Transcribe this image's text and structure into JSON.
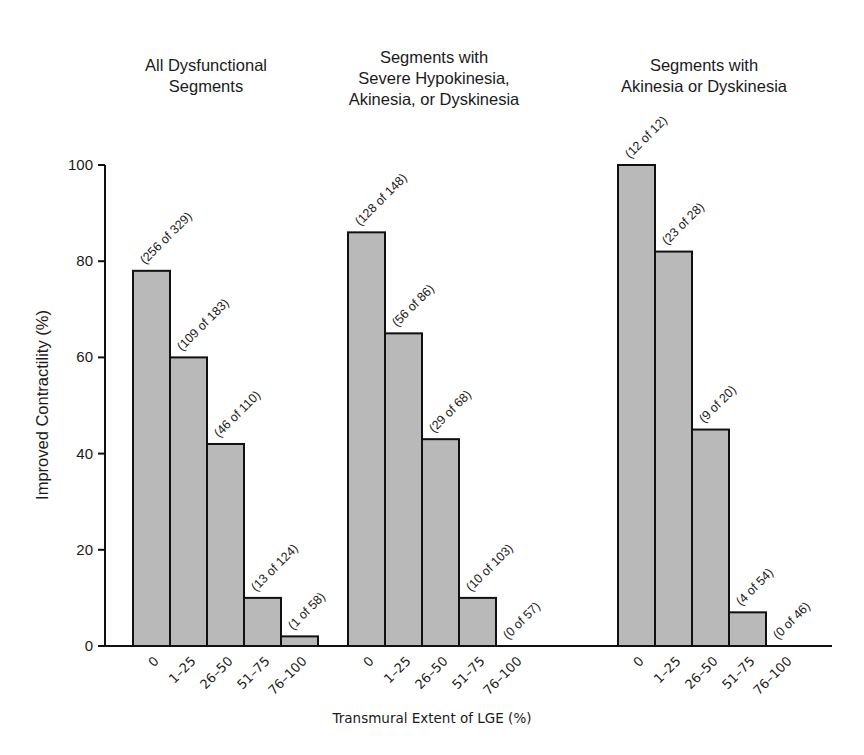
{
  "chart_data": {
    "type": "bar",
    "title": "",
    "ylabel": "Improved Contractility (%)",
    "xlabel": "Transmural Extent of LGE (%)",
    "ylim": [
      0,
      100
    ],
    "yticks": [
      0,
      20,
      40,
      60,
      80,
      100
    ],
    "grid": false,
    "legend": null,
    "categories": [
      "0",
      "1–25",
      "26–50",
      "51–75",
      "76–100"
    ],
    "panels": [
      {
        "title_lines": [
          "All Dysfunctional",
          "Segments"
        ],
        "values": [
          78,
          60,
          42,
          10,
          2
        ],
        "annotations": [
          "(256 of 329)",
          "(109 of 183)",
          "(46 of 110)",
          "(13 of 124)",
          "(1 of 58)"
        ]
      },
      {
        "title_lines": [
          "Segments with",
          "Severe Hypokinesia,",
          "Akinesia, or Dyskinesia"
        ],
        "values": [
          86,
          65,
          43,
          10,
          0
        ],
        "annotations": [
          "(128 of 148)",
          "(56 of 86)",
          "(29 of 68)",
          "(10 of 103)",
          "(0 of 57)"
        ]
      },
      {
        "title_lines": [
          "Segments with",
          "Akinesia or Dyskinesia"
        ],
        "values": [
          100,
          82,
          45,
          7,
          0
        ],
        "annotations": [
          "(12 of 12)",
          "(23 of 28)",
          "(9 of 20)",
          "(4 of 54)",
          "(0 of 46)"
        ]
      }
    ]
  },
  "style": {
    "bar_fill": "#b9b9b9",
    "bar_stroke": "#111111",
    "axis_color": "#111111"
  }
}
